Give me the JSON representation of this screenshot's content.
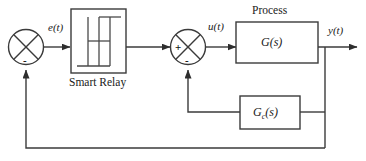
{
  "diagram": {
    "signals": {
      "error": "e(t)",
      "control": "u(t)",
      "output": "y(t)"
    },
    "blocks": {
      "relay": {
        "caption": "Smart Relay",
        "symbol": "hysteresis-relay"
      },
      "process": {
        "caption": "Process",
        "label_main": "G",
        "label_args": "(s)"
      },
      "controller": {
        "label_main": "G",
        "label_sub": "c",
        "label_args": "(s)"
      }
    },
    "summing_junctions": {
      "outer": {
        "name": "outer-summing-junction",
        "sign_bottom": "-"
      },
      "inner": {
        "name": "inner-summing-junction",
        "sign_left": "+",
        "sign_bottom": "-"
      }
    },
    "colors": {
      "line": "#3b3b3b",
      "text": "#1a1a1a",
      "background": "#ffffff"
    }
  }
}
